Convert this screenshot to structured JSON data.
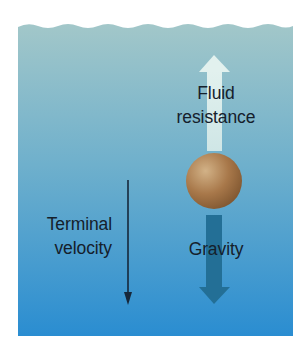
{
  "diagram": {
    "labels": {
      "fluid_line1": "Fluid",
      "fluid_line2": "resistance",
      "terminal_line1": "Terminal",
      "terminal_line2": "velocity",
      "gravity": "Gravity"
    },
    "elements": {
      "fluid_body": "water column with wavy surface",
      "object": "brown sphere",
      "up_arrow": "fluid resistance force (upward)",
      "down_arrow": "gravity force (downward)",
      "thin_arrow": "terminal velocity direction (downward)"
    },
    "colors": {
      "water_top": "#a2c7c9",
      "water_mid": "#5ea8cc",
      "water_bottom": "#2a8dd1",
      "up_arrow": "#d8ecea",
      "down_arrow": "#236f96",
      "sphere_light": "#d2b287",
      "sphere_dark": "#7f5630",
      "text": "#15202b"
    }
  }
}
